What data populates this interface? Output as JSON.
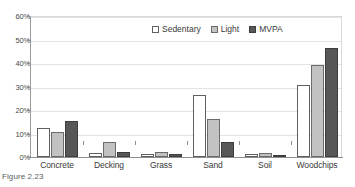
{
  "caption": "Figure 2.23",
  "chart_data": {
    "type": "bar",
    "title": "",
    "xlabel": "",
    "ylabel": "",
    "ylim": [
      0,
      60
    ],
    "yticks": [
      "0%",
      "10%",
      "20%",
      "30%",
      "40%",
      "50%",
      "60%"
    ],
    "ytick_values": [
      0,
      10,
      20,
      30,
      40,
      50,
      60
    ],
    "grid": true,
    "legend_position": "top-center",
    "categories": [
      "Concrete",
      "Decking",
      "Grass",
      "Sand",
      "Soil",
      "Woodchips"
    ],
    "series": [
      {
        "name": "Sedentary",
        "color": "#ffffff",
        "values": [
          12.5,
          1.5,
          1.3,
          26.5,
          1.2,
          30.5
        ]
      },
      {
        "name": "Light",
        "color": "#c2c2c2",
        "values": [
          10.6,
          6.6,
          2.3,
          16.3,
          1.8,
          39.0
        ]
      },
      {
        "name": "MVPA",
        "color": "#575757",
        "values": [
          15.5,
          2.3,
          1.2,
          6.4,
          1.0,
          46.6
        ]
      }
    ]
  }
}
